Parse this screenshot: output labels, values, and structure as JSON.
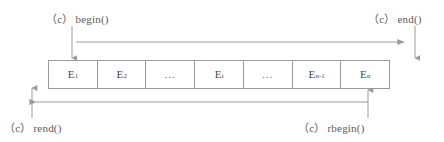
{
  "diagram": {
    "colors": {
      "line": "#9a9a9a",
      "text": "#5a5a5a",
      "cell_text": "#4a4a4a",
      "background": "#ffffff"
    },
    "labels": {
      "begin": {
        "prefix": "（c）",
        "name": "begin()"
      },
      "end": {
        "prefix": "（c）",
        "name": "end()"
      },
      "rend": {
        "prefix": "（c）",
        "name": "rend()"
      },
      "rbegin": {
        "prefix": "（c）",
        "name": "rbegin()"
      }
    },
    "cells": [
      {
        "base": "E",
        "sub": "1",
        "ellipsis": false,
        "text": "…"
      },
      {
        "base": "E",
        "sub": "2",
        "ellipsis": false,
        "text": "…"
      },
      {
        "base": "",
        "sub": "",
        "ellipsis": true,
        "text": "…"
      },
      {
        "base": "E",
        "sub": "i",
        "ellipsis": false,
        "text": "…"
      },
      {
        "base": "",
        "sub": "",
        "ellipsis": true,
        "text": "…"
      },
      {
        "base": "E",
        "sub": "n-1",
        "ellipsis": false,
        "text": "…"
      },
      {
        "base": "E",
        "sub": "n",
        "ellipsis": false,
        "text": "…"
      }
    ]
  }
}
